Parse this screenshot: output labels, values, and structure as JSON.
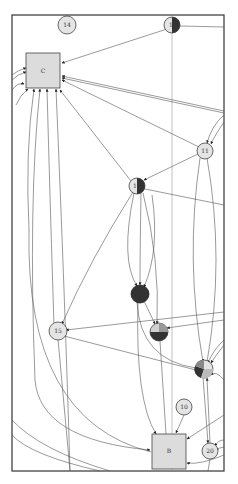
{
  "graph": {
    "nodes": [
      {
        "id": "14",
        "label": "14",
        "shape": "circle",
        "fill": "light"
      },
      {
        "id": "1",
        "label": "1",
        "shape": "circle",
        "fill": "half-dark"
      },
      {
        "id": "C",
        "label": "C",
        "shape": "box",
        "fill": "light"
      },
      {
        "id": "11",
        "label": "11",
        "shape": "circle",
        "fill": "light"
      },
      {
        "id": "1b",
        "label": "1",
        "shape": "circle",
        "fill": "half-dark"
      },
      {
        "id": "dark",
        "label": "",
        "shape": "circle",
        "fill": "dark"
      },
      {
        "id": "15",
        "label": "15",
        "shape": "circle",
        "fill": "light"
      },
      {
        "id": "pie1",
        "label": "",
        "shape": "circle",
        "fill": "pie"
      },
      {
        "id": "pie2",
        "label": "",
        "shape": "circle",
        "fill": "pie"
      },
      {
        "id": "10",
        "label": "10",
        "shape": "circle",
        "fill": "light"
      },
      {
        "id": "B",
        "label": "B",
        "shape": "box",
        "fill": "light"
      },
      {
        "id": "20",
        "label": "20",
        "shape": "circle",
        "fill": "light"
      }
    ]
  }
}
